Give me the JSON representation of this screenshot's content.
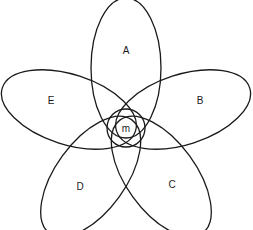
{
  "diagram": {
    "type": "five-set petal diagram",
    "center": {
      "x": 126,
      "y": 128
    },
    "stroke_color": "#1a1a1a",
    "petal": {
      "rx": 35,
      "ry": 70,
      "offset": 60
    },
    "sets": [
      {
        "label": "A",
        "angle": 0,
        "label_x": 126,
        "label_y": 51
      },
      {
        "label": "B",
        "angle": 72,
        "label_x": 200,
        "label_y": 101
      },
      {
        "label": "C",
        "angle": 144,
        "label_x": 172,
        "label_y": 185
      },
      {
        "label": "D",
        "angle": 216,
        "label_x": 80,
        "label_y": 187
      },
      {
        "label": "E",
        "angle": 288,
        "label_x": 51,
        "label_y": 101
      }
    ],
    "core": {
      "label": "m",
      "cx": 126,
      "cy": 128,
      "r": 19
    }
  }
}
